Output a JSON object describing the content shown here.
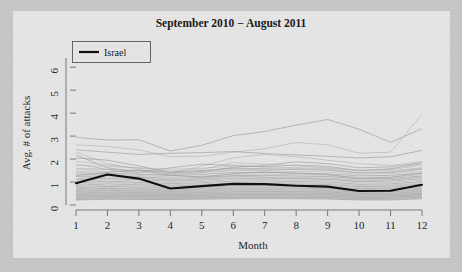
{
  "figure": {
    "title": "September 2010 − August 2011",
    "background_color": "#e4e4e4",
    "page_color": "#c6c6c6"
  },
  "legend": {
    "position": "top-left",
    "entries": [
      {
        "label": "Israel",
        "color": "#101010",
        "style": "thick-solid-line"
      }
    ]
  },
  "axes": {
    "x": {
      "label": "Month",
      "ticks": [
        "1",
        "2",
        "3",
        "4",
        "5",
        "6",
        "7",
        "8",
        "9",
        "10",
        "11",
        "12"
      ],
      "range": [
        1,
        12
      ]
    },
    "y": {
      "label": "Avg. # of attacks",
      "ticks": [
        "0",
        "1",
        "2",
        "3",
        "4",
        "5",
        "6"
      ],
      "range": [
        0,
        6.4
      ]
    }
  },
  "chart_data": {
    "type": "line",
    "title": "September 2010 − August 2011",
    "xlabel": "Month",
    "ylabel": "Avg. # of attacks",
    "x": [
      1,
      2,
      3,
      4,
      5,
      6,
      7,
      8,
      9,
      10,
      11,
      12
    ],
    "xlim": [
      1,
      12
    ],
    "ylim": [
      0,
      6.4
    ],
    "grid": false,
    "legend_position": "top-left",
    "highlight_color": "#101010",
    "background_color": "#9a9a9a",
    "series": [
      {
        "name": "Israel",
        "highlight": true,
        "color": "#101010",
        "values": [
          0.95,
          1.33,
          1.15,
          0.72,
          0.82,
          0.92,
          0.91,
          0.84,
          0.8,
          0.61,
          0.62,
          0.88
        ]
      },
      {
        "name": "bg-01",
        "highlight": false,
        "values": [
          2.94,
          2.83,
          2.84,
          2.35,
          2.6,
          3.02,
          3.2,
          3.48,
          3.72,
          3.3,
          2.73,
          3.32
        ]
      },
      {
        "name": "bg-02",
        "highlight": false,
        "values": [
          2.62,
          2.55,
          2.4,
          2.1,
          2.12,
          2.3,
          2.45,
          2.72,
          2.62,
          2.25,
          2.3,
          3.95
        ]
      },
      {
        "name": "bg-03",
        "highlight": false,
        "values": [
          2.4,
          2.3,
          2.2,
          2.25,
          2.28,
          2.33,
          2.24,
          2.18,
          2.12,
          2.05,
          2.1,
          2.38
        ]
      },
      {
        "name": "bg-04",
        "highlight": false,
        "values": [
          2.3,
          1.8,
          1.55,
          1.35,
          1.7,
          2.05,
          2.2,
          2.1,
          1.95,
          1.8,
          1.72,
          1.9
        ]
      },
      {
        "name": "bg-05",
        "highlight": false,
        "values": [
          2.18,
          1.62,
          1.42,
          1.62,
          1.78,
          1.72,
          1.66,
          1.74,
          1.68,
          1.5,
          1.58,
          1.8
        ]
      },
      {
        "name": "bg-06",
        "highlight": false,
        "values": [
          1.72,
          1.68,
          1.62,
          1.56,
          1.6,
          1.7,
          1.66,
          1.62,
          1.6,
          1.48,
          1.5,
          1.62
        ]
      },
      {
        "name": "bg-07",
        "highlight": false,
        "values": [
          1.58,
          1.55,
          1.5,
          1.44,
          1.5,
          1.6,
          1.58,
          1.55,
          1.52,
          1.4,
          1.42,
          1.55
        ]
      },
      {
        "name": "bg-08",
        "highlight": false,
        "values": [
          1.48,
          1.46,
          1.42,
          1.36,
          1.4,
          1.5,
          1.5,
          1.46,
          1.44,
          1.34,
          1.36,
          1.46
        ]
      },
      {
        "name": "bg-09",
        "highlight": false,
        "values": [
          1.4,
          1.38,
          1.34,
          1.28,
          1.33,
          1.42,
          1.42,
          1.39,
          1.36,
          1.27,
          1.29,
          1.38
        ]
      },
      {
        "name": "bg-10",
        "highlight": false,
        "values": [
          1.32,
          1.34,
          1.28,
          1.22,
          1.26,
          1.34,
          1.35,
          1.32,
          1.3,
          1.2,
          1.22,
          1.32
        ]
      },
      {
        "name": "bg-11",
        "highlight": false,
        "values": [
          1.24,
          1.28,
          1.22,
          1.16,
          1.2,
          1.28,
          1.29,
          1.26,
          1.24,
          1.14,
          1.16,
          1.26
        ]
      },
      {
        "name": "bg-12",
        "highlight": false,
        "values": [
          1.16,
          1.22,
          1.16,
          1.1,
          1.14,
          1.22,
          1.23,
          1.2,
          1.18,
          1.08,
          1.1,
          1.2
        ]
      },
      {
        "name": "bg-13",
        "highlight": false,
        "values": [
          1.09,
          1.16,
          1.1,
          1.04,
          1.08,
          1.16,
          1.17,
          1.14,
          1.12,
          1.02,
          1.04,
          1.14
        ]
      },
      {
        "name": "bg-14",
        "highlight": false,
        "values": [
          1.02,
          1.1,
          1.04,
          0.98,
          1.02,
          1.1,
          1.11,
          1.08,
          1.06,
          0.96,
          0.98,
          1.08
        ]
      },
      {
        "name": "bg-15",
        "highlight": false,
        "values": [
          0.96,
          1.04,
          0.98,
          0.93,
          0.97,
          1.04,
          1.05,
          1.02,
          1.0,
          0.9,
          0.92,
          1.02
        ]
      },
      {
        "name": "bg-16",
        "highlight": false,
        "values": [
          0.9,
          0.98,
          0.93,
          0.88,
          0.92,
          0.98,
          0.99,
          0.96,
          0.94,
          0.85,
          0.87,
          0.96
        ]
      },
      {
        "name": "bg-17",
        "highlight": false,
        "values": [
          0.85,
          0.92,
          0.88,
          0.83,
          0.87,
          0.93,
          0.94,
          0.91,
          0.89,
          0.8,
          0.82,
          0.91
        ]
      },
      {
        "name": "bg-18",
        "highlight": false,
        "values": [
          0.8,
          0.86,
          0.83,
          0.79,
          0.82,
          0.88,
          0.89,
          0.86,
          0.84,
          0.76,
          0.78,
          0.86
        ]
      },
      {
        "name": "bg-19",
        "highlight": false,
        "values": [
          0.75,
          0.81,
          0.78,
          0.74,
          0.77,
          0.83,
          0.84,
          0.81,
          0.79,
          0.71,
          0.73,
          0.81
        ]
      },
      {
        "name": "bg-20",
        "highlight": false,
        "values": [
          0.71,
          0.76,
          0.73,
          0.7,
          0.73,
          0.78,
          0.79,
          0.77,
          0.75,
          0.67,
          0.69,
          0.77
        ]
      },
      {
        "name": "bg-21",
        "highlight": false,
        "values": [
          0.67,
          0.72,
          0.69,
          0.66,
          0.69,
          0.74,
          0.75,
          0.73,
          0.71,
          0.63,
          0.65,
          0.73
        ]
      },
      {
        "name": "bg-22",
        "highlight": false,
        "values": [
          0.63,
          0.68,
          0.65,
          0.62,
          0.65,
          0.7,
          0.71,
          0.69,
          0.67,
          0.6,
          0.61,
          0.69
        ]
      },
      {
        "name": "bg-23",
        "highlight": false,
        "values": [
          0.59,
          0.64,
          0.61,
          0.59,
          0.61,
          0.66,
          0.67,
          0.65,
          0.63,
          0.56,
          0.58,
          0.65
        ]
      },
      {
        "name": "bg-24",
        "highlight": false,
        "values": [
          0.56,
          0.6,
          0.58,
          0.55,
          0.58,
          0.62,
          0.63,
          0.61,
          0.6,
          0.53,
          0.55,
          0.62
        ]
      },
      {
        "name": "bg-25",
        "highlight": false,
        "values": [
          0.52,
          0.56,
          0.54,
          0.52,
          0.54,
          0.58,
          0.59,
          0.58,
          0.56,
          0.5,
          0.51,
          0.58
        ]
      },
      {
        "name": "bg-26",
        "highlight": false,
        "values": [
          0.49,
          0.53,
          0.51,
          0.49,
          0.51,
          0.55,
          0.56,
          0.54,
          0.53,
          0.47,
          0.48,
          0.55
        ]
      },
      {
        "name": "bg-27",
        "highlight": false,
        "values": [
          0.46,
          0.49,
          0.48,
          0.46,
          0.48,
          0.51,
          0.52,
          0.51,
          0.5,
          0.44,
          0.45,
          0.51
        ]
      },
      {
        "name": "bg-28",
        "highlight": false,
        "values": [
          0.43,
          0.46,
          0.45,
          0.43,
          0.45,
          0.48,
          0.49,
          0.48,
          0.47,
          0.41,
          0.42,
          0.48
        ]
      },
      {
        "name": "bg-29",
        "highlight": false,
        "values": [
          0.4,
          0.43,
          0.42,
          0.4,
          0.42,
          0.45,
          0.46,
          0.45,
          0.44,
          0.38,
          0.39,
          0.45
        ]
      },
      {
        "name": "bg-30",
        "highlight": false,
        "values": [
          0.37,
          0.4,
          0.39,
          0.38,
          0.39,
          0.42,
          0.43,
          0.42,
          0.41,
          0.36,
          0.36,
          0.42
        ]
      },
      {
        "name": "bg-31",
        "highlight": false,
        "values": [
          0.34,
          0.37,
          0.36,
          0.35,
          0.36,
          0.39,
          0.4,
          0.39,
          0.38,
          0.33,
          0.34,
          0.39
        ]
      },
      {
        "name": "bg-32",
        "highlight": false,
        "values": [
          0.31,
          0.34,
          0.33,
          0.32,
          0.33,
          0.36,
          0.37,
          0.36,
          0.35,
          0.3,
          0.31,
          0.36
        ]
      },
      {
        "name": "bg-33",
        "highlight": false,
        "values": [
          0.28,
          0.31,
          0.3,
          0.29,
          0.3,
          0.33,
          0.34,
          0.33,
          0.32,
          0.27,
          0.28,
          0.33
        ]
      },
      {
        "name": "bg-34",
        "highlight": false,
        "values": [
          0.25,
          0.28,
          0.27,
          0.27,
          0.28,
          0.3,
          0.31,
          0.3,
          0.29,
          0.25,
          0.25,
          0.3
        ]
      },
      {
        "name": "bg-35",
        "highlight": false,
        "values": [
          0.22,
          0.25,
          0.24,
          0.24,
          0.25,
          0.27,
          0.28,
          0.27,
          0.26,
          0.22,
          0.22,
          0.27
        ]
      },
      {
        "name": "bg-36",
        "highlight": false,
        "values": [
          1.9,
          1.75,
          1.6,
          1.48,
          1.55,
          1.84,
          1.78,
          1.7,
          1.62,
          1.52,
          1.55,
          1.72
        ]
      },
      {
        "name": "bg-37",
        "highlight": false,
        "values": [
          2.05,
          1.95,
          1.7,
          1.4,
          1.46,
          1.64,
          1.72,
          1.88,
          1.8,
          1.62,
          1.66,
          1.84
        ]
      },
      {
        "name": "bg-38",
        "highlight": false,
        "values": [
          1.8,
          1.55,
          1.34,
          1.3,
          1.42,
          1.56,
          1.52,
          1.58,
          1.56,
          1.4,
          1.44,
          1.6
        ]
      },
      {
        "name": "bg-39",
        "highlight": false,
        "values": [
          1.28,
          1.42,
          1.52,
          1.3,
          1.22,
          1.36,
          1.44,
          1.38,
          1.32,
          1.16,
          1.2,
          1.4
        ]
      },
      {
        "name": "bg-40",
        "highlight": false,
        "values": [
          1.12,
          1.3,
          1.22,
          1.06,
          1.16,
          1.26,
          1.2,
          1.16,
          1.14,
          1.04,
          1.1,
          1.22
        ]
      }
    ]
  }
}
